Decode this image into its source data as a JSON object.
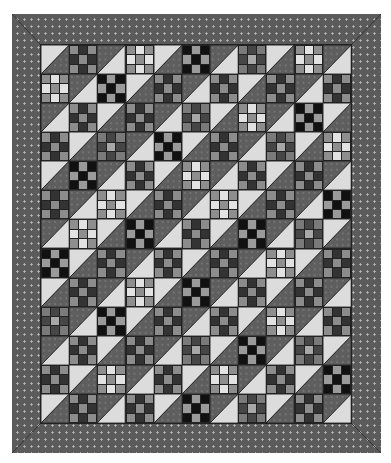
{
  "image": {
    "subject": "quilt",
    "layout": {
      "columns": 11,
      "rows": 13,
      "border": "mitered dotted dark gray"
    },
    "colors": {
      "border_fabric": "#5b5b5b",
      "border_dot": "#b8b8b8",
      "seam": "#222222",
      "hst_light": "#dcdcdc",
      "hst_dark": "#5e5e5e"
    },
    "ninepatch_palettes": {
      "A": {
        "corner": "#8c8c8c",
        "edge": "#333333",
        "center": "#8c8c8c"
      },
      "B": {
        "corner": "#111111",
        "edge": "#9a9a9a",
        "center": "#111111"
      },
      "C": {
        "corner": "#8e8e8e",
        "edge": "#e2e2e2",
        "center": "#8e8e8e"
      },
      "D": {
        "corner": "#7a7a7a",
        "edge": "#464646",
        "center": "#a8a8a8"
      }
    },
    "ninepatch_rows": [
      [
        "A",
        "C",
        "B",
        "D",
        "C"
      ],
      [
        "C",
        "B",
        "A",
        "A",
        "A",
        "A"
      ],
      [
        "A",
        "A",
        "D",
        "C",
        "B"
      ],
      [
        "A",
        "D",
        "B",
        "A",
        "D",
        "C"
      ],
      [
        "B",
        "A",
        "C",
        "A",
        "A"
      ],
      [
        "A",
        "C",
        "A",
        "C",
        "A",
        "B"
      ],
      [
        "C",
        "B",
        "A",
        "B",
        "D"
      ],
      [
        "B",
        "A",
        "A",
        "A",
        "C",
        "A"
      ],
      [
        "A",
        "C",
        "B",
        "A",
        "A"
      ],
      [
        "D",
        "B",
        "A",
        "A",
        "C",
        "A"
      ],
      [
        "A",
        "A",
        "D",
        "B",
        "D"
      ],
      [
        "A",
        "C",
        "A",
        "C",
        "A",
        "B"
      ],
      [
        "A",
        "A",
        "B",
        "D",
        "A"
      ]
    ]
  }
}
